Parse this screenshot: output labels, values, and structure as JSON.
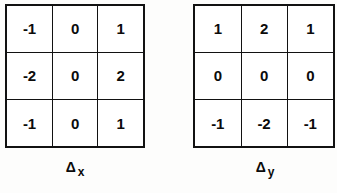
{
  "figure": {
    "background_color": "#fdfdfc",
    "ink_color": "#121212",
    "kernels": [
      {
        "id": "delta-x",
        "caption_symbol": "Δ",
        "caption_subscript": "x",
        "rows": [
          [
            "-1",
            "0",
            "1"
          ],
          [
            "-2",
            "0",
            "2"
          ],
          [
            "-1",
            "0",
            "1"
          ]
        ]
      },
      {
        "id": "delta-y",
        "caption_symbol": "Δ",
        "caption_subscript": "y",
        "rows": [
          [
            "1",
            "2",
            "1"
          ],
          [
            "0",
            "0",
            "0"
          ],
          [
            "-1",
            "-2",
            "-1"
          ]
        ]
      }
    ]
  }
}
